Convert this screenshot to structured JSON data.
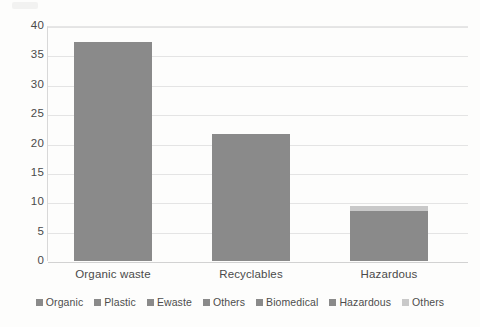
{
  "chart_data": {
    "type": "bar",
    "title": "",
    "subtitle": "",
    "xlabel": "",
    "ylabel": "",
    "categories": [
      "Organic waste",
      "Recyclables",
      "Hazardous"
    ],
    "values": [
      37.2,
      21.7,
      9.3
    ],
    "series": [
      {
        "name": "Main",
        "color": "#8a8a8a",
        "values": [
          37.2,
          21.7,
          8.5
        ]
      },
      {
        "name": "Others",
        "color": "#c9c9c9",
        "values": [
          0,
          0,
          0.8
        ]
      }
    ],
    "ylim": [
      0,
      40
    ],
    "ytick_labels": [
      "40",
      "35",
      "30",
      "25",
      "20",
      "15",
      "10",
      "5",
      "0"
    ],
    "ytick_values": [
      40,
      35,
      30,
      25,
      20,
      15,
      10,
      5,
      0
    ],
    "ystep": 5,
    "grid": true,
    "grid_axis": "y",
    "legend_position": "bottom",
    "legend": [
      {
        "label": "Organic",
        "color": "#8a8a8a"
      },
      {
        "label": "Plastic",
        "color": "#8a8a8a"
      },
      {
        "label": "Ewaste",
        "color": "#8a8a8a"
      },
      {
        "label": "Others",
        "color": "#8a8a8a"
      },
      {
        "label": "Biomedical",
        "color": "#8a8a8a"
      },
      {
        "label": "Hazardous",
        "color": "#8a8a8a"
      },
      {
        "label": "Others",
        "color": "#c9c9c9"
      }
    ]
  },
  "colors": {
    "bar": "#8a8a8a",
    "bar_cap": "#c9c9c9",
    "gridline": "#e4e4e4",
    "axis": "#d2d2d2",
    "text": "#4a4a4a",
    "background": "#fdfdfc"
  }
}
